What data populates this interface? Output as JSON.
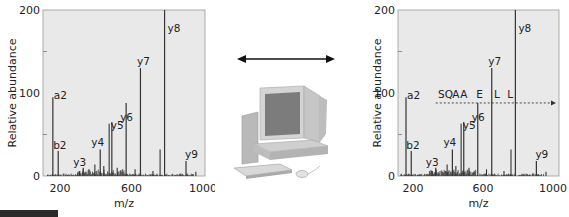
{
  "chart_data": [
    {
      "type": "bar",
      "subtype": "mass-spectrum-stick-plot",
      "title": "",
      "xlabel": "m/z",
      "ylabel": "Relative abundance",
      "xlim": [
        120,
        1010
      ],
      "ylim": [
        0,
        200
      ],
      "x_ticks": [
        200,
        600,
        1000
      ],
      "y_ticks": [
        0,
        100,
        200
      ],
      "y_minor_ticks": [
        50,
        150
      ],
      "grid": false,
      "legend": null,
      "labeled_peaks": [
        {
          "label": "a2",
          "mz": 160,
          "abundance": 95
        },
        {
          "label": "b2",
          "mz": 190,
          "abundance": 30
        },
        {
          "label": "y3",
          "mz": 330,
          "abundance": 10
        },
        {
          "label": "y4",
          "mz": 425,
          "abundance": 32
        },
        {
          "label": "y5",
          "mz": 490,
          "abundance": 65
        },
        {
          "label": "y6",
          "mz": 570,
          "abundance": 88
        },
        {
          "label": "y7",
          "mz": 650,
          "abundance": 130
        },
        {
          "label": "y8",
          "mz": 785,
          "abundance": 200
        },
        {
          "label": "y9",
          "mz": 905,
          "abundance": 18
        }
      ],
      "unlabeled_peaks": [
        {
          "mz": 475,
          "abundance": 63
        },
        {
          "mz": 760,
          "abundance": 32
        },
        {
          "mz": 310,
          "abundance": 6
        },
        {
          "mz": 395,
          "abundance": 14
        },
        {
          "mz": 445,
          "abundance": 12
        },
        {
          "mz": 520,
          "abundance": 10
        },
        {
          "mz": 620,
          "abundance": 8
        },
        {
          "mz": 720,
          "abundance": 6
        },
        {
          "mz": 960,
          "abundance": 5
        }
      ]
    },
    {
      "type": "bar",
      "subtype": "mass-spectrum-stick-plot",
      "title": "",
      "xlabel": "m/z",
      "ylabel": "Relative abundance",
      "xlim": [
        120,
        1010
      ],
      "ylim": [
        0,
        200
      ],
      "x_ticks": [
        200,
        600,
        1000
      ],
      "y_ticks": [
        0,
        100,
        200
      ],
      "y_minor_ticks": [
        50,
        150
      ],
      "grid": false,
      "legend": null,
      "labeled_peaks": [
        {
          "label": "a2",
          "mz": 160,
          "abundance": 95
        },
        {
          "label": "b2",
          "mz": 190,
          "abundance": 30
        },
        {
          "label": "y3",
          "mz": 330,
          "abundance": 10
        },
        {
          "label": "y4",
          "mz": 425,
          "abundance": 32
        },
        {
          "label": "y5",
          "mz": 490,
          "abundance": 65
        },
        {
          "label": "y6",
          "mz": 570,
          "abundance": 88
        },
        {
          "label": "y7",
          "mz": 650,
          "abundance": 130
        },
        {
          "label": "y8",
          "mz": 785,
          "abundance": 200
        },
        {
          "label": "y9",
          "mz": 905,
          "abundance": 18
        }
      ],
      "unlabeled_peaks": [
        {
          "mz": 475,
          "abundance": 63
        },
        {
          "mz": 760,
          "abundance": 32
        },
        {
          "mz": 310,
          "abundance": 6
        },
        {
          "mz": 395,
          "abundance": 14
        },
        {
          "mz": 445,
          "abundance": 12
        },
        {
          "mz": 520,
          "abundance": 10
        },
        {
          "mz": 620,
          "abundance": 8
        },
        {
          "mz": 720,
          "abundance": 6
        },
        {
          "mz": 960,
          "abundance": 5
        }
      ],
      "annotation": {
        "type": "sequence-ladder",
        "sequence": [
          "S",
          "Q",
          "A",
          "A",
          "E",
          "L",
          "L"
        ],
        "y_level": 88,
        "mz_start": 330,
        "mz_end": 1000
      }
    }
  ],
  "left_chart": {
    "y_label": "Relative abundance",
    "x_label": "m/z",
    "y_ticks": [
      "0",
      "100",
      "200"
    ],
    "x_ticks": [
      "200",
      "600",
      "1000"
    ]
  },
  "right_chart": {
    "y_label": "Relative abundance",
    "x_label": "m/z",
    "y_ticks": [
      "0",
      "100",
      "200"
    ],
    "x_ticks": [
      "200",
      "600",
      "1000"
    ],
    "sequence": [
      "S",
      "Q",
      "A",
      "A",
      "E",
      "L",
      "L"
    ]
  },
  "middle": {
    "arrow": "double-headed-arrow",
    "icon": "desktop-computer"
  },
  "colors": {
    "plot_background": "#e9e9e9",
    "peak": "#333333",
    "axis_text": "#222222"
  }
}
